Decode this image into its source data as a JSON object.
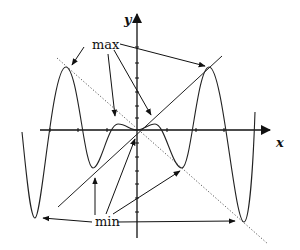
{
  "figure": {
    "type": "function-graph-annotation",
    "axes": {
      "x_label": "x",
      "y_label": "y"
    },
    "annotations": {
      "max_label": "max",
      "min_label": "min"
    },
    "lines": [
      {
        "name": "line-y-equals-x",
        "style": "solid"
      },
      {
        "name": "line-y-equals-neg-x",
        "style": "dotted"
      }
    ],
    "curve": {
      "description": "even polynomial-like oscillating curve tangent to y=x at maxima and to y=-x at minima",
      "local_maxima_count": 4,
      "local_minima_count": 4
    },
    "colors": {
      "ink": "#222222",
      "background": "#ffffff"
    }
  }
}
